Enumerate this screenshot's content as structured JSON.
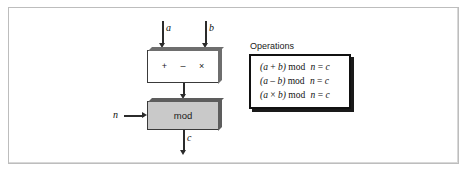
{
  "figure": {
    "background_color": "#ffffff",
    "frame_border_color": "#bdbdbd"
  },
  "diagram": {
    "alu_block": {
      "name": "arithmetic-unit",
      "fill_color": "#ffffff",
      "border_color": "#3a3a3a",
      "shadow_color": "#6e6e6e",
      "operators": [
        "+",
        "–",
        "×"
      ]
    },
    "mod_block": {
      "name": "mod-unit",
      "label": "mod",
      "fill_color": "#c9c9c9",
      "border_color": "#3a3a3a",
      "shadow_color": "#5d5d5d"
    },
    "signals": {
      "input_a": "a",
      "input_b": "b",
      "input_n": "n",
      "output_c": "c"
    },
    "arrow_color": "#2b2b2b"
  },
  "operations": {
    "title": "Operations",
    "box_border_color": "#111111",
    "box_shadow_color": "#1a1a1a",
    "rows": [
      {
        "open": "(",
        "lhs": "a",
        "operator": "+",
        "rhs": "b",
        "close": ")",
        "mod": "mod",
        "modulus": "n",
        "equals": "=",
        "result": "c",
        "full": "(a + b) mod n = c"
      },
      {
        "open": "(",
        "lhs": "a",
        "operator": "–",
        "rhs": "b",
        "close": ")",
        "mod": "mod",
        "modulus": "n",
        "equals": "=",
        "result": "c",
        "full": "(a – b) mod n = c"
      },
      {
        "open": "(",
        "lhs": "a",
        "operator": "×",
        "rhs": "b",
        "close": ")",
        "mod": "mod",
        "modulus": "n",
        "equals": "=",
        "result": "c",
        "full": "(a × b) mod n = c"
      }
    ]
  }
}
